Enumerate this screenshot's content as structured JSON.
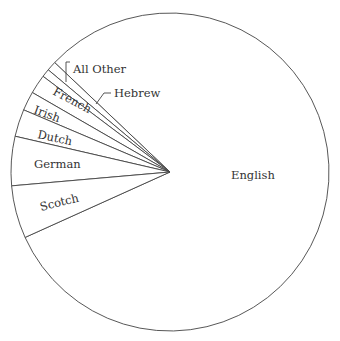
{
  "chart_data": {
    "type": "pie",
    "title": "",
    "center": [
      170,
      172
    ],
    "radius": 159,
    "colors": {
      "fill": "#ffffff",
      "stroke": "#444444",
      "text": "#333333"
    },
    "slices": [
      {
        "label": "English",
        "start_deg": 204.3,
        "end_deg": 496.5,
        "percent": 81.2
      },
      {
        "label": "All Other",
        "start_deg": 136.5,
        "end_deg": 140.0,
        "percent": 1.0
      },
      {
        "label": "Hebrew",
        "start_deg": 140.0,
        "end_deg": 143.0,
        "percent": 0.8
      },
      {
        "label": "French",
        "start_deg": 143.0,
        "end_deg": 150.0,
        "percent": 1.9
      },
      {
        "label": "Irish",
        "start_deg": 150.0,
        "end_deg": 157.0,
        "percent": 1.9
      },
      {
        "label": "Dutch",
        "start_deg": 157.0,
        "end_deg": 167.0,
        "percent": 2.8
      },
      {
        "label": "German",
        "start_deg": 167.0,
        "end_deg": 185.0,
        "percent": 5.0
      },
      {
        "label": "Scotch",
        "start_deg": 185.0,
        "end_deg": 204.3,
        "percent": 5.4
      }
    ],
    "labels": [
      {
        "text": "English",
        "x": 231,
        "y": 179,
        "rotate": 0
      },
      {
        "text": "All Other",
        "x": 73,
        "y": 73,
        "rotate": 0
      },
      {
        "text": "Hebrew",
        "x": 114,
        "y": 97,
        "rotate": 0
      },
      {
        "text": "French",
        "x": 52,
        "y": 94,
        "rotate": 28
      },
      {
        "text": "Irish",
        "x": 33,
        "y": 113,
        "rotate": 20
      },
      {
        "text": "Dutch",
        "x": 37,
        "y": 138,
        "rotate": 12
      },
      {
        "text": "German",
        "x": 34,
        "y": 168,
        "rotate": 0
      },
      {
        "text": "Scotch",
        "x": 41,
        "y": 211,
        "rotate": -14
      }
    ],
    "leaders": [
      {
        "for": "All Other",
        "points": [
          [
            70,
            62
          ],
          [
            66,
            62
          ],
          [
            66,
            82
          ]
        ]
      },
      {
        "for": "Hebrew",
        "points": [
          [
            111,
            93
          ],
          [
            104,
            93
          ],
          [
            96,
            104
          ]
        ]
      }
    ]
  }
}
